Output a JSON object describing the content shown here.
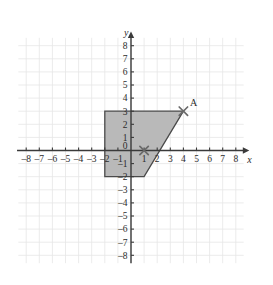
{
  "figure": {
    "title_visible": false,
    "axes": {
      "x_axis_label": "x",
      "y_axis_label": "y",
      "x_ticks": [
        "-8",
        "-7",
        "-6",
        "-5",
        "-4",
        "-3",
        "-2",
        "-1",
        "1",
        "2",
        "3",
        "4",
        "5",
        "6",
        "7",
        "8"
      ],
      "y_ticks": [
        "8",
        "7",
        "6",
        "5",
        "4",
        "3",
        "2",
        "1",
        "-1",
        "-2",
        "-3",
        "-4",
        "-5",
        "-6",
        "-7",
        "-8"
      ],
      "origin_label": "0"
    },
    "colors": {
      "grid": "#e6e6e6",
      "axis": "#3a3a3a",
      "shape_fill": "#b9b9b9",
      "shape_stroke": "#4a4a4a",
      "marker": "#6a6a6a",
      "text": "#2b2b2b",
      "background": "#ffffff"
    },
    "shape": {
      "name": "shaded-quadrilateral",
      "vertices": [
        {
          "x": -2,
          "y": 3
        },
        {
          "x": 4,
          "y": 3
        },
        {
          "x": 1,
          "y": -2
        },
        {
          "x": -2,
          "y": -2
        }
      ]
    },
    "markers": [
      {
        "name": "point-a",
        "label": "A",
        "x": 4,
        "y": 3,
        "glyph": "cross-marker"
      },
      {
        "name": "point-unlabeled",
        "label": "",
        "x": 1,
        "y": 0,
        "glyph": "cross-marker"
      }
    ]
  },
  "chart_data": {
    "type": "scatter",
    "title": "",
    "xlabel": "x",
    "ylabel": "y",
    "xlim": [
      -8,
      8
    ],
    "ylim": [
      -8,
      8
    ],
    "grid": true,
    "legend": "none",
    "xticks": [
      -8,
      -7,
      -6,
      -5,
      -4,
      -3,
      -2,
      -1,
      0,
      1,
      2,
      3,
      4,
      5,
      6,
      7,
      8
    ],
    "yticks": [
      -8,
      -7,
      -6,
      -5,
      -4,
      -3,
      -2,
      -1,
      0,
      1,
      2,
      3,
      4,
      5,
      6,
      7,
      8
    ],
    "polygons": [
      {
        "name": "shaded-quadrilateral",
        "fill": "#b9b9b9",
        "stroke": "#4a4a4a",
        "points": [
          [
            -2,
            3
          ],
          [
            4,
            3
          ],
          [
            1,
            -2
          ],
          [
            -2,
            -2
          ]
        ]
      }
    ],
    "points": [
      {
        "label": "A",
        "x": 4,
        "y": 3
      },
      {
        "label": "",
        "x": 1,
        "y": 0
      }
    ],
    "annotations": [
      {
        "text": "A",
        "x": 4,
        "y": 3,
        "offset": "above-right"
      }
    ]
  }
}
